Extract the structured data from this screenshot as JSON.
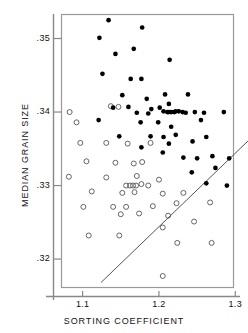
{
  "chart_data": {
    "type": "scatter",
    "title": "",
    "xlabel": "SORTING COEFFICIENT",
    "ylabel": "MEDIAN GRAIN SIZE",
    "xlim": [
      1.073,
      1.297
    ],
    "ylim": [
      0.3162,
      0.3532
    ],
    "xticks": [
      1.1,
      1.2,
      1.3
    ],
    "xtick_labels": [
      "1.1",
      "1.2",
      "1.3"
    ],
    "yticks": [
      0.32,
      0.33,
      0.34,
      0.35
    ],
    "ytick_labels": [
      ".32",
      ".33",
      ".34",
      ".35"
    ],
    "grid": false,
    "legend": "none",
    "frame": true,
    "series": [
      {
        "name": "filled-circles",
        "marker": "filled-circle",
        "color": "#000000",
        "size": 3.0,
        "points": [
          [
            1.134,
            0.3525
          ],
          [
            1.122,
            0.3501
          ],
          [
            1.178,
            0.3515
          ],
          [
            1.143,
            0.3479
          ],
          [
            1.167,
            0.3486
          ],
          [
            1.214,
            0.3471
          ],
          [
            1.126,
            0.3452
          ],
          [
            1.163,
            0.3445
          ],
          [
            1.177,
            0.3445
          ],
          [
            1.152,
            0.3423
          ],
          [
            1.184,
            0.3418
          ],
          [
            1.208,
            0.3424
          ],
          [
            1.238,
            0.3424
          ],
          [
            1.16,
            0.3407
          ],
          [
            1.19,
            0.3404
          ],
          [
            1.201,
            0.3406
          ],
          [
            1.213,
            0.3411
          ],
          [
            1.222,
            0.3401
          ],
          [
            1.231,
            0.34
          ],
          [
            1.14,
            0.3406
          ],
          [
            1.171,
            0.3399
          ],
          [
            1.186,
            0.3398
          ],
          [
            1.206,
            0.3401
          ],
          [
            1.211,
            0.34
          ],
          [
            1.213,
            0.34
          ],
          [
            1.216,
            0.34
          ],
          [
            1.22,
            0.34
          ],
          [
            1.226,
            0.3401
          ],
          [
            1.235,
            0.3399
          ],
          [
            1.247,
            0.34
          ],
          [
            1.259,
            0.3399
          ],
          [
            1.285,
            0.34
          ],
          [
            1.121,
            0.3389
          ],
          [
            1.176,
            0.3386
          ],
          [
            1.199,
            0.3386
          ],
          [
            1.216,
            0.338
          ],
          [
            1.255,
            0.3389
          ],
          [
            1.148,
            0.3367
          ],
          [
            1.189,
            0.3367
          ],
          [
            1.206,
            0.3366
          ],
          [
            1.222,
            0.3369
          ],
          [
            1.262,
            0.3366
          ],
          [
            1.177,
            0.3352
          ],
          [
            1.213,
            0.3357
          ],
          [
            1.244,
            0.336
          ],
          [
            1.205,
            0.3345
          ],
          [
            1.232,
            0.3338
          ],
          [
            1.25,
            0.3337
          ],
          [
            1.27,
            0.334
          ],
          [
            1.292,
            0.3337
          ],
          [
            1.243,
            0.3318
          ],
          [
            1.274,
            0.3324
          ],
          [
            1.262,
            0.3303
          ],
          [
            1.289,
            0.33
          ]
        ]
      },
      {
        "name": "open-circles",
        "marker": "open-circle",
        "color": "#555555",
        "size": 3.2,
        "points": [
          [
            1.083,
            0.34
          ],
          [
            1.137,
            0.3408
          ],
          [
            1.147,
            0.3407
          ],
          [
            1.092,
            0.3386
          ],
          [
            1.097,
            0.3358
          ],
          [
            1.131,
            0.3358
          ],
          [
            1.159,
            0.3357
          ],
          [
            1.189,
            0.3358
          ],
          [
            1.105,
            0.3333
          ],
          [
            1.143,
            0.3331
          ],
          [
            1.167,
            0.333
          ],
          [
            1.178,
            0.3332
          ],
          [
            1.082,
            0.3312
          ],
          [
            1.131,
            0.3311
          ],
          [
            1.171,
            0.3313
          ],
          [
            1.2,
            0.3308
          ],
          [
            1.157,
            0.33
          ],
          [
            1.162,
            0.33
          ],
          [
            1.166,
            0.33
          ],
          [
            1.17,
            0.33
          ],
          [
            1.177,
            0.3302
          ],
          [
            1.186,
            0.33
          ],
          [
            1.112,
            0.3292
          ],
          [
            1.152,
            0.329
          ],
          [
            1.168,
            0.3291
          ],
          [
            1.205,
            0.3289
          ],
          [
            1.232,
            0.329
          ],
          [
            1.101,
            0.3271
          ],
          [
            1.14,
            0.3271
          ],
          [
            1.157,
            0.3271
          ],
          [
            1.192,
            0.3272
          ],
          [
            1.223,
            0.3276
          ],
          [
            1.267,
            0.3277
          ],
          [
            1.15,
            0.3261
          ],
          [
            1.174,
            0.3262
          ],
          [
            1.212,
            0.3259
          ],
          [
            1.246,
            0.3251
          ],
          [
            1.108,
            0.3232
          ],
          [
            1.148,
            0.3232
          ],
          [
            1.205,
            0.3243
          ],
          [
            1.224,
            0.3222
          ],
          [
            1.269,
            0.3222
          ],
          [
            1.205,
            0.3177
          ]
        ]
      }
    ],
    "annotations": [
      {
        "type": "line",
        "name": "diagonal-reference-line",
        "x0": 1.124,
        "y0": 0.3168,
        "x1": 1.322,
        "y1": 0.3366,
        "color": "#555555"
      }
    ]
  },
  "axes": {
    "y_title": "MEDIAN GRAIN SIZE",
    "x_title": "SORTING COEFFICIENT"
  }
}
